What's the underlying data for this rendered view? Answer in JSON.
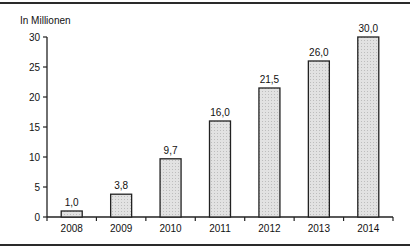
{
  "chart_data": {
    "type": "bar",
    "title": "",
    "unit_label": "In Millionen",
    "xlabel": "",
    "ylabel": "In Millionen",
    "categories": [
      "2008",
      "2009",
      "2010",
      "2011",
      "2012",
      "2013",
      "2014"
    ],
    "values": [
      1.0,
      3.8,
      9.7,
      16.0,
      21.5,
      26.0,
      30.0
    ],
    "value_labels": [
      "1,0",
      "3,8",
      "9,7",
      "16,0",
      "21,5",
      "26,0",
      "30,0"
    ],
    "ylim": [
      0,
      30
    ],
    "yticks": [
      0,
      5,
      10,
      15,
      20,
      25,
      30
    ],
    "grid": false,
    "legend": null,
    "bar_fill": "#d9d9d9",
    "bar_stroke": "#222222"
  }
}
